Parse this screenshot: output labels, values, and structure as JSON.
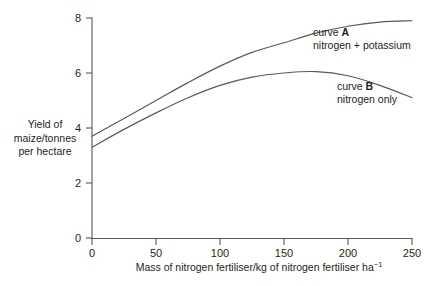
{
  "chart_data": {
    "type": "line",
    "title": "",
    "xlabel": "Mass of nitrogen fertiliser/kg of nitrogen fertiliser ha",
    "xlabel_exponent": "−1",
    "ylabel_lines": [
      "Yield of",
      "maize/tonnes",
      "per hectare"
    ],
    "xlim": [
      0,
      250
    ],
    "ylim": [
      0,
      8
    ],
    "xticks": [
      0,
      50,
      100,
      150,
      200,
      250
    ],
    "yticks": [
      0,
      2,
      4,
      6,
      8
    ],
    "xtick_labels": [
      "0",
      "50",
      "100",
      "150",
      "200",
      "250"
    ],
    "ytick_labels": [
      "0",
      "2",
      "4",
      "6",
      "8"
    ],
    "grid": false,
    "legend_position": "inline-annotations",
    "line_color": "#58595b",
    "axis_color": "#58595b",
    "text_color": "#231f20",
    "series": [
      {
        "name": "curve A",
        "description": "nitrogen + potassium",
        "x": [
          0,
          25,
          50,
          75,
          100,
          125,
          150,
          175,
          200,
          225,
          250
        ],
        "values": [
          3.7,
          4.35,
          5.0,
          5.65,
          6.25,
          6.75,
          7.1,
          7.45,
          7.7,
          7.85,
          7.9
        ]
      },
      {
        "name": "curve B",
        "description": "nitrogen only",
        "x": [
          0,
          25,
          50,
          75,
          100,
          125,
          150,
          175,
          200,
          225,
          250
        ],
        "values": [
          3.3,
          3.95,
          4.55,
          5.1,
          5.55,
          5.85,
          6.0,
          6.05,
          5.9,
          5.55,
          5.1
        ]
      }
    ],
    "annotations": [
      {
        "id": "curve-a",
        "label": "curve A",
        "label_prefix": "curve ",
        "label_key": "A",
        "sublabel": "nitrogen + potassium"
      },
      {
        "id": "curve-b",
        "label": "curve B",
        "label_prefix": "curve ",
        "label_key": "B",
        "sublabel": "nitrogen only"
      }
    ]
  }
}
